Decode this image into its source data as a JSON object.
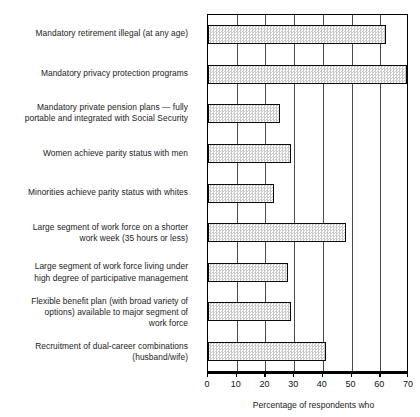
{
  "chart_data": {
    "type": "bar",
    "orientation": "horizontal",
    "title": "",
    "xlabel": "Percentage of respondents who",
    "ylabel": "",
    "xlim": [
      0,
      70
    ],
    "xticks": [
      0,
      10,
      20,
      30,
      40,
      50,
      60,
      70
    ],
    "grid": true,
    "legend": "none",
    "categories": [
      "Mandatory retirement illegal (at any age)",
      "Mandatory privacy protection programs",
      "Mandatory private pension plans — fully\nportable and integrated with Social Security",
      "Women achieve parity status with men",
      "Minorities achieve parity status with whites",
      "Large segment of work force on a shorter\nwork week (35 hours or less)",
      "Large segment of work force living under\nhigh degree of participative management",
      "Flexible benefit plan (with broad variety of\noptions) available to major segment of\nwork force",
      "Recruitment of dual-career combinations\n(husband/wife)"
    ],
    "values": [
      62,
      70,
      25,
      29,
      23,
      48,
      28,
      29,
      41
    ],
    "bar_fill": "#c9c9c9",
    "bar_edge": "#0a0a0a",
    "grid_color": "#4a4a4a"
  }
}
